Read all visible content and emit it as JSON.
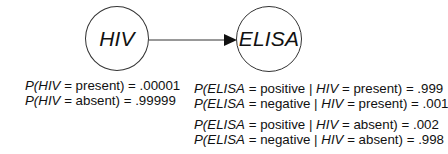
{
  "nodes": {
    "hiv": {
      "label": "HIV"
    },
    "elisa": {
      "label": "ELISA"
    }
  },
  "edges": [
    {
      "from": "HIV",
      "to": "ELISA",
      "type": "directed-arrow"
    }
  ],
  "hiv_priors": [
    {
      "prefix": "P(",
      "var": "HIV",
      "mid": " = present) = ",
      "value": ".00001"
    },
    {
      "prefix": "P(",
      "var": "HIV",
      "mid": " = absent) = ",
      "value": ".99999"
    }
  ],
  "elisa_given_present": [
    {
      "prefix": "P(",
      "var": "ELISA",
      "mid1": " = positive | ",
      "cond": "HIV",
      "mid2": " = present) = ",
      "value": ".999"
    },
    {
      "prefix": "P(",
      "var": "ELISA",
      "mid1": " = negative | ",
      "cond": "HIV",
      "mid2": " = present) = ",
      "value": ".001"
    }
  ],
  "elisa_given_absent": [
    {
      "prefix": "P(",
      "var": "ELISA",
      "mid1": " = positive | ",
      "cond": "HIV",
      "mid2": " = absent) = ",
      "value": ".002"
    },
    {
      "prefix": "P(",
      "var": "ELISA",
      "mid1": " = negative | ",
      "cond": "HIV",
      "mid2": " = absent) = ",
      "value": ".998"
    }
  ],
  "colors": {
    "stroke": "#333333",
    "text": "#111111",
    "background": "#ffffff"
  }
}
